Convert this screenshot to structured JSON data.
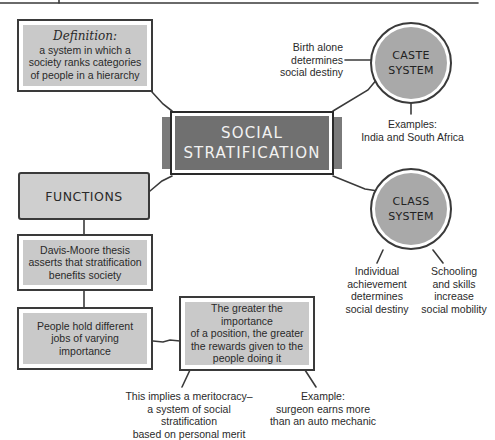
{
  "diagram": {
    "central": {
      "line1": "SOCIAL",
      "line2": "STRATIFICATION"
    },
    "definition": {
      "title": "Definition:",
      "lines": [
        "a system in which a",
        "society ranks categories",
        "of people in a hierarchy"
      ]
    },
    "caste": {
      "label1": "CASTE",
      "label2": "SYSTEM",
      "note_left": [
        "Birth alone",
        "determines",
        "social destiny"
      ],
      "note_below": [
        "Examples:",
        "India and South Africa"
      ]
    },
    "class": {
      "label1": "CLASS",
      "label2": "SYSTEM",
      "note_left": [
        "Individual",
        "achievement",
        "determines",
        "social destiny"
      ],
      "note_right": [
        "Schooling",
        "and skills",
        "increase",
        "social mobility"
      ]
    },
    "functions": {
      "title": "FUNCTIONS",
      "davis_moore": [
        "Davis-Moore thesis",
        "asserts that stratification",
        "benefits society"
      ],
      "jobs": [
        "People hold different",
        "jobs of varying",
        "importance"
      ],
      "rewards": [
        "The greater the importance",
        "of a position, the greater",
        "the rewards given to the",
        "people doing it"
      ],
      "meritocracy": [
        "This implies a meritocracy–",
        "a system of social stratification",
        "based on personal merit"
      ],
      "example": [
        "Example:",
        "surgeon earns more",
        "than an auto mechanic"
      ]
    }
  },
  "colors": {
    "box_fill": "#c9c9c9",
    "center_fill": "#707070",
    "circle_fill": "#a9a9a9",
    "line": "#3a3a3a"
  }
}
